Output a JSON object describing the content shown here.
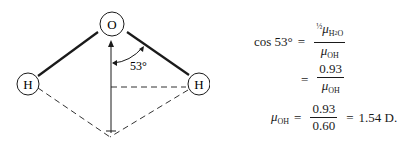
{
  "diagram": {
    "atoms": {
      "oxygen": "O",
      "hydrogen_left": "H",
      "hydrogen_right": "H"
    },
    "angle_label": "53°"
  },
  "equations": {
    "line1": {
      "lhs": "cos 53°",
      "equals": "=",
      "num_half": "½",
      "num_mu": "μ",
      "num_sub": "H",
      "num_sub2": "2",
      "num_sub3": "O",
      "den_mu": "μ",
      "den_sub": "OH"
    },
    "line2": {
      "equals": "=",
      "num": "0.93",
      "den_mu": "μ",
      "den_sub": "OH"
    },
    "line3": {
      "lhs_mu": "μ",
      "lhs_sub": "OH",
      "equals": "=",
      "num": "0.93",
      "den": "0.60",
      "equals2": "=",
      "result": "1.54 D."
    }
  }
}
